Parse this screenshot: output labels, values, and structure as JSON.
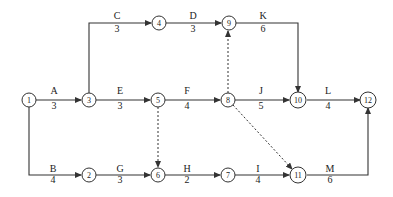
{
  "diagram": {
    "type": "activity-on-arrow network",
    "nodes": [
      {
        "id": "1",
        "x": 29,
        "y": 100
      },
      {
        "id": "2",
        "x": 89,
        "y": 175
      },
      {
        "id": "3",
        "x": 89,
        "y": 100
      },
      {
        "id": "4",
        "x": 159,
        "y": 23
      },
      {
        "id": "5",
        "x": 158,
        "y": 100
      },
      {
        "id": "6",
        "x": 158,
        "y": 175
      },
      {
        "id": "7",
        "x": 228,
        "y": 175
      },
      {
        "id": "8",
        "x": 228,
        "y": 100
      },
      {
        "id": "9",
        "x": 229,
        "y": 23
      },
      {
        "id": "10",
        "x": 298,
        "y": 100
      },
      {
        "id": "11",
        "x": 298,
        "y": 175
      },
      {
        "id": "12",
        "x": 368,
        "y": 100
      }
    ],
    "activities": [
      {
        "name": "A",
        "duration": "3",
        "from": "1",
        "to": "3"
      },
      {
        "name": "B",
        "duration": "4",
        "from": "1",
        "to": "2"
      },
      {
        "name": "C",
        "duration": "3",
        "from": "3",
        "to": "4"
      },
      {
        "name": "D",
        "duration": "3",
        "from": "4",
        "to": "9"
      },
      {
        "name": "E",
        "duration": "3",
        "from": "3",
        "to": "5"
      },
      {
        "name": "F",
        "duration": "4",
        "from": "5",
        "to": "8"
      },
      {
        "name": "G",
        "duration": "3",
        "from": "2",
        "to": "6"
      },
      {
        "name": "H",
        "duration": "2",
        "from": "6",
        "to": "7"
      },
      {
        "name": "I",
        "duration": "4",
        "from": "7",
        "to": "11"
      },
      {
        "name": "J",
        "duration": "5",
        "from": "8",
        "to": "10"
      },
      {
        "name": "K",
        "duration": "6",
        "from": "9",
        "to": "10"
      },
      {
        "name": "L",
        "duration": "4",
        "from": "10",
        "to": "12"
      },
      {
        "name": "M",
        "duration": "6",
        "from": "11",
        "to": "12"
      }
    ],
    "dummies": [
      {
        "from": "5",
        "to": "6"
      },
      {
        "from": "8",
        "to": "9"
      },
      {
        "from": "8",
        "to": "11"
      }
    ],
    "labels": {
      "A": {
        "x": 54,
        "y": 94,
        "dx": 54,
        "dy": 109
      },
      "B": {
        "x": 53,
        "y": 172,
        "dx": 53,
        "dy": 183
      },
      "C": {
        "x": 117,
        "y": 19,
        "dx": 117,
        "dy": 32
      },
      "D": {
        "x": 193,
        "y": 19,
        "dx": 193,
        "dy": 32
      },
      "E": {
        "x": 120,
        "y": 94,
        "dx": 120,
        "dy": 109
      },
      "F": {
        "x": 187,
        "y": 94,
        "dx": 187,
        "dy": 109
      },
      "G": {
        "x": 120,
        "y": 172,
        "dx": 120,
        "dy": 183
      },
      "H": {
        "x": 187,
        "y": 172,
        "dx": 187,
        "dy": 183
      },
      "I": {
        "x": 258,
        "y": 172,
        "dx": 258,
        "dy": 183
      },
      "J": {
        "x": 261,
        "y": 94,
        "dx": 261,
        "dy": 109
      },
      "K": {
        "x": 263,
        "y": 19,
        "dx": 263,
        "dy": 32
      },
      "L": {
        "x": 328,
        "y": 94,
        "dx": 328,
        "dy": 109
      },
      "M": {
        "x": 330,
        "y": 172,
        "dx": 330,
        "dy": 183
      }
    }
  }
}
